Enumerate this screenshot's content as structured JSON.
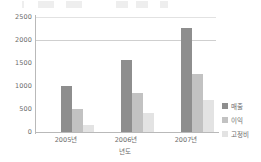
{
  "chart_data": {
    "type": "bar",
    "title": "",
    "xlabel": "년도",
    "ylabel": "",
    "categories": [
      "2005년",
      "2006년",
      "2007년"
    ],
    "series": [
      {
        "name": "매출",
        "values": [
          1000,
          1570,
          2270
        ],
        "color": "#8e8e8e"
      },
      {
        "name": "이익",
        "values": [
          500,
          850,
          1270
        ],
        "color": "#c2c2c2"
      },
      {
        "name": "고정비",
        "values": [
          150,
          420,
          700
        ],
        "color": "#e3e3e3"
      }
    ],
    "ylim": [
      0,
      2500
    ],
    "yticks": [
      0,
      500,
      1000,
      1500,
      2000,
      2500
    ],
    "ytick_labels": [
      "0",
      "500",
      "1000",
      "1500",
      "2000",
      "2500"
    ],
    "grid": true,
    "gridlines_at": [
      2000,
      2500
    ],
    "legend_position": "right"
  },
  "colors": {
    "series_sales": "#8e8e8e",
    "series_profit": "#c2c2c2",
    "series_fixed_cost": "#e3e3e3",
    "axis": "#b9b9b9",
    "gridline": "#cfcfcf",
    "text": "#6b6b6b",
    "background": "#ffffff"
  }
}
